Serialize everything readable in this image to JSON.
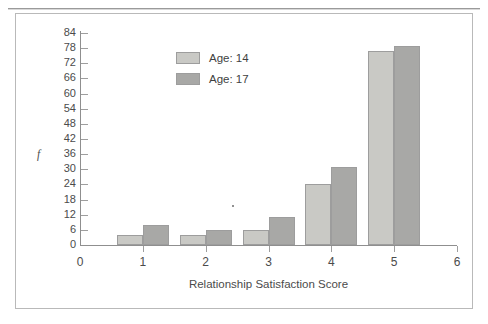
{
  "figure": {
    "y_axis_label": "f",
    "x_axis_title": "Relationship Satisfaction Score"
  },
  "legend": {
    "items": [
      {
        "label": "Age: 14",
        "color": "#c9c9c5",
        "swatch_name": "legend-swatch-age-14"
      },
      {
        "label": "Age: 17",
        "color": "#a8a8a6",
        "swatch_name": "legend-swatch-age-17"
      }
    ]
  },
  "y_ticks": [
    "84",
    "78",
    "72",
    "66",
    "60",
    "54",
    "48",
    "42",
    "36",
    "30",
    "24",
    "18",
    "12",
    "6",
    "0"
  ],
  "x_ticks": [
    "0",
    "1",
    "2",
    "3",
    "4",
    "5",
    "6"
  ],
  "chart_data": {
    "type": "bar",
    "title": "",
    "subtitle": "",
    "xlabel": "Relationship Satisfaction Score",
    "ylabel": "f",
    "categories": [
      "1",
      "2",
      "3",
      "4",
      "5"
    ],
    "series": [
      {
        "name": "Age: 14",
        "color": "#c9c9c5",
        "values": [
          4,
          4,
          6,
          24,
          77
        ]
      },
      {
        "name": "Age: 17",
        "color": "#a8a8a6",
        "values": [
          8,
          6,
          11,
          31,
          79
        ]
      }
    ],
    "ylim": [
      0,
      84
    ],
    "ytick_interval": 6,
    "xlim": [
      0,
      6
    ],
    "grid": false,
    "legend_position": "upper-center-left",
    "bar_style": "grouped-adjacent"
  }
}
